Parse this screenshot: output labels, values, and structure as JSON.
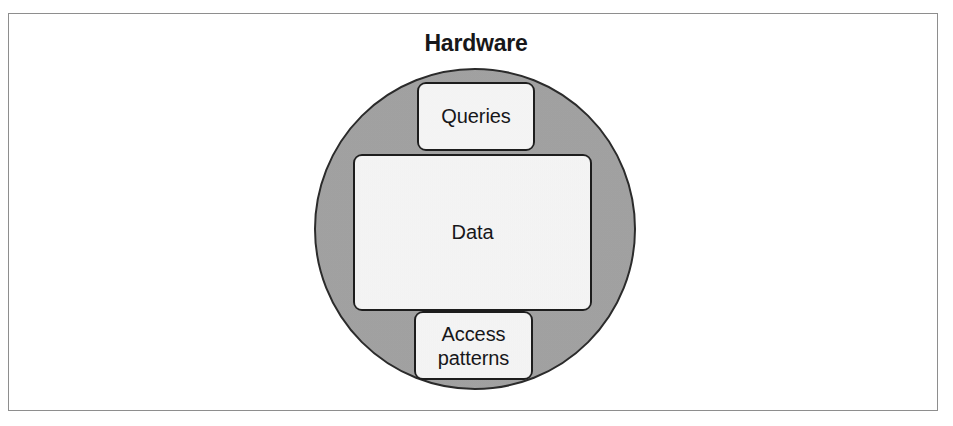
{
  "figure": {
    "type": "concentric-containment-diagram",
    "outer_label": "Hardware",
    "outer_shape": "circle",
    "outer_fill_color": "#a3a3a3",
    "outer_border_color": "#2b2b2b",
    "box_fill_color": "#f1f1f1",
    "box_border_color": "#1d1d1d",
    "frame_border_color": "#8e8e8e",
    "boxes": [
      {
        "id": "queries",
        "label": "Queries",
        "position": "top"
      },
      {
        "id": "data",
        "label": "Data",
        "position": "center"
      },
      {
        "id": "access-patterns",
        "label_line_1": "Access",
        "label_line_2": "patterns",
        "position": "bottom"
      }
    ]
  }
}
